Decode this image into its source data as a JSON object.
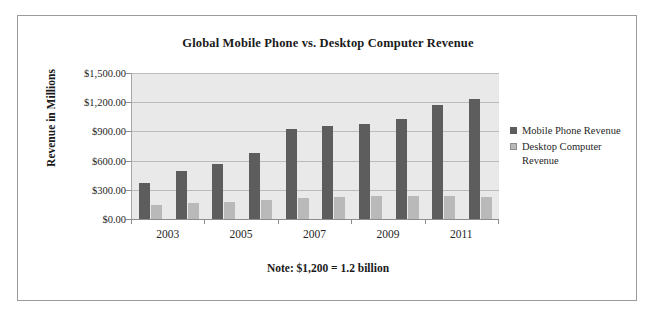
{
  "chart_data": {
    "type": "bar",
    "title": "Global Mobile Phone vs. Desktop Computer Revenue",
    "xlabel": "",
    "ylabel": "Revenue in Millions",
    "note": "Note: $1,200 = 1.2 billion",
    "categories": [
      "2003",
      "2004",
      "2005",
      "2006",
      "2007",
      "2008",
      "2009",
      "2010",
      "2011",
      "2012"
    ],
    "tick_labels_shown": [
      "2003",
      "2005",
      "2007",
      "2009",
      "2011"
    ],
    "series": [
      {
        "name": "Mobile Phone Revenue",
        "color": "#5d5d5d",
        "values": [
          370,
          490,
          565,
          680,
          925,
          960,
          975,
          1030,
          1175,
          1230
        ]
      },
      {
        "name": "Desktop Computer Revenue",
        "color": "#b9b9b9",
        "values": [
          140,
          160,
          175,
          200,
          215,
          230,
          235,
          235,
          235,
          230
        ]
      }
    ],
    "ylim": [
      0,
      1500
    ],
    "y_ticks": [
      0,
      300,
      600,
      900,
      1200,
      1500
    ],
    "y_tick_labels": [
      "$0.00",
      "$300.00",
      "$600.00",
      "$900.00",
      "$1,200.00",
      "$1,500.00"
    ],
    "grid": true,
    "legend_position": "right",
    "plot_background": "#e9e9e9",
    "frame_border": "#9a9a9a"
  }
}
